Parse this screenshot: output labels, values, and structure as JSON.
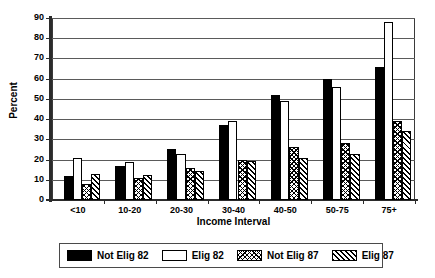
{
  "chart_data": {
    "type": "bar",
    "title": "",
    "xlabel": "Income Interval",
    "ylabel": "Percent",
    "categories": [
      "<10",
      "10-20",
      "20-30",
      "30-40",
      "40-50",
      "50-75",
      "75+"
    ],
    "ylim": [
      0,
      90
    ],
    "yticks": [
      0,
      10,
      20,
      30,
      40,
      50,
      60,
      70,
      80,
      90
    ],
    "grid": true,
    "legend_position": "bottom",
    "series": [
      {
        "name": "Not Elig 82",
        "pattern": "solid-black",
        "values": [
          12,
          17,
          25,
          37,
          52,
          60,
          66
        ]
      },
      {
        "name": "Elig 82",
        "pattern": "white-empty",
        "values": [
          21,
          19,
          23,
          39,
          49,
          56,
          88
        ]
      },
      {
        "name": "Not Elig 87",
        "pattern": "cross-hatch",
        "values": [
          8,
          11,
          16,
          20,
          26,
          28,
          39
        ]
      },
      {
        "name": "Elig 87",
        "pattern": "diagonal-hatch",
        "values": [
          13,
          12.5,
          14.5,
          19.5,
          21,
          23,
          34
        ]
      }
    ]
  },
  "legend": {
    "items": [
      {
        "label": "Not Elig 82",
        "pattern": "solid-black"
      },
      {
        "label": "Elig 82",
        "pattern": "white-empty"
      },
      {
        "label": "Not Elig 87",
        "pattern": "cross-hatch"
      },
      {
        "label": "Elig 87",
        "pattern": "diagonal-hatch"
      }
    ]
  },
  "colors": {
    "series_1": "#000000",
    "series_2": "#ffffff",
    "hatch": "#000000",
    "axis": "#2b2b2b",
    "grid": "#5a5a5a",
    "background": "#ffffff"
  }
}
